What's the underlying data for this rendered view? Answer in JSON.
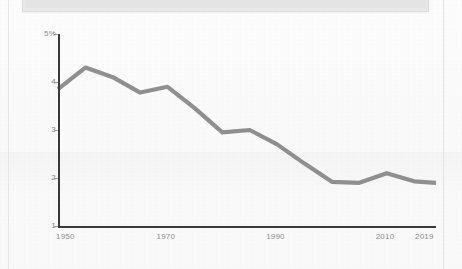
{
  "page": {
    "background_color": "#fbfbfb",
    "border_color": "#e6e6e6"
  },
  "header_box": {
    "name": "cropped-header-panel",
    "fill_color": "#e8e8e8"
  },
  "chart_data": {
    "type": "line",
    "title": "",
    "subtitle": "",
    "xlabel": "",
    "ylabel": "",
    "line_color": "#8f8f8f",
    "axis_color": "#3a3a3a",
    "tick_label_color": "#8b8b8b",
    "grid": false,
    "legend": null,
    "legend_position": "none",
    "xlim": [
      1950,
      2019
    ],
    "ylim": [
      1,
      5
    ],
    "x_ticks": [
      1950,
      1970,
      1990,
      2010,
      2019
    ],
    "x_tick_labels": [
      "1950",
      "1970",
      "1990",
      "2010",
      "2019"
    ],
    "y_ticks": [
      5,
      4,
      3,
      2,
      1
    ],
    "y_tick_labels": [
      "5%",
      "4",
      "3",
      "2",
      "1"
    ],
    "series": [
      {
        "name": "rate",
        "x": [
          1950,
          1955,
          1960,
          1965,
          1970,
          1975,
          1980,
          1985,
          1990,
          1995,
          2000,
          2005,
          2010,
          2015,
          2019
        ],
        "values": [
          3.85,
          4.3,
          4.1,
          3.78,
          3.9,
          3.45,
          2.95,
          3.0,
          2.7,
          2.3,
          1.92,
          1.9,
          2.1,
          1.93,
          1.9
        ]
      }
    ]
  }
}
